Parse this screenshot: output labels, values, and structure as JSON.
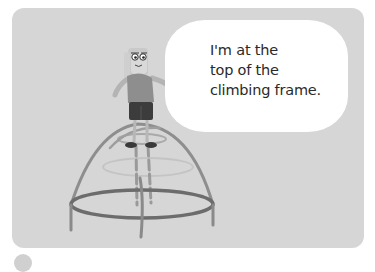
{
  "illustration": {
    "background_color": "#d6d6d6",
    "speech_bubble": {
      "lines": [
        "I'm at the",
        "top of the",
        "climbing frame."
      ]
    },
    "character": {
      "description": "child standing on top of a dome climbing frame"
    },
    "climbing_frame": {
      "description": "dome-shaped climbing frame"
    }
  }
}
